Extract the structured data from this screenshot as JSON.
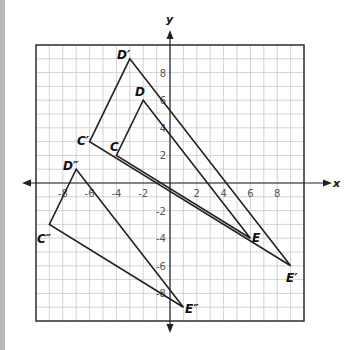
{
  "chart_data": {
    "type": "scatter",
    "title": "",
    "xlabel": "x",
    "ylabel": "y",
    "xlim": [
      -10,
      10
    ],
    "ylim": [
      -10,
      10
    ],
    "grid": true,
    "x_ticks": [
      -8,
      -6,
      -4,
      -2,
      2,
      4,
      6,
      8
    ],
    "y_ticks": [
      8,
      6,
      4,
      2,
      -2,
      -4,
      -6,
      -8
    ],
    "series": [
      {
        "name": "Triangle CDE",
        "points": [
          {
            "label": "C",
            "x": -4,
            "y": 2
          },
          {
            "label": "D",
            "x": -2,
            "y": 6
          },
          {
            "label": "E",
            "x": 6,
            "y": -4
          }
        ]
      },
      {
        "name": "Triangle C'D'E'",
        "points": [
          {
            "label": "C′",
            "x": -6,
            "y": 3
          },
          {
            "label": "D′",
            "x": -3,
            "y": 9
          },
          {
            "label": "E′",
            "x": 9,
            "y": -6
          }
        ]
      },
      {
        "name": "Triangle C''D''E''",
        "points": [
          {
            "label": "C″",
            "x": -9,
            "y": -3
          },
          {
            "label": "D″",
            "x": -7,
            "y": 1
          },
          {
            "label": "E″",
            "x": 1,
            "y": -9
          }
        ]
      }
    ]
  },
  "axes": {
    "x_label": "x",
    "y_label": "y"
  },
  "labels": {
    "C": "C",
    "D": "D",
    "E": "E",
    "C1": "C′",
    "D1": "D′",
    "E1": "E′",
    "C2": "C″",
    "D2": "D″",
    "E2": "E″"
  },
  "ticks": {
    "x": [
      "-8",
      "-6",
      "-4",
      "-2",
      "2",
      "4",
      "6",
      "8"
    ],
    "y": [
      "8",
      "6",
      "4",
      "2",
      "-2",
      "-4",
      "-6",
      "-8"
    ]
  }
}
